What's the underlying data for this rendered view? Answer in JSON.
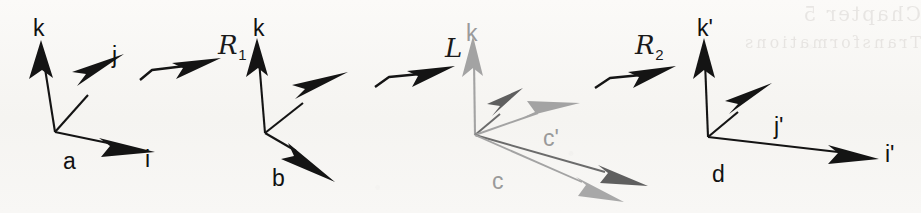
{
  "figure": {
    "kind": "vector-frame-transformation-diagram",
    "width": 921,
    "height": 213,
    "background_color": "#f7f6f4",
    "ink_color": "#111111",
    "mid_gray_color": "#5f5f5f",
    "light_gray_color": "#a3a3a3"
  },
  "operators": [
    {
      "name": "operator-r1",
      "text": "R",
      "subscript": "1"
    },
    {
      "name": "operator-l",
      "text": "L",
      "subscript": ""
    },
    {
      "name": "operator-r2",
      "text": "R",
      "subscript": "2"
    }
  ],
  "frames": [
    {
      "name": "frame-a",
      "origin_label": "a",
      "axis_labels": [
        "k",
        "j",
        "i"
      ]
    },
    {
      "name": "frame-b",
      "origin_label": "b",
      "axis_labels": [
        "k"
      ]
    },
    {
      "name": "frame-c",
      "origin_label": "c",
      "axis_labels": [
        "k",
        "c'"
      ]
    },
    {
      "name": "frame-d",
      "origin_label": "d",
      "axis_labels": [
        "k'",
        "j'",
        "i'"
      ]
    }
  ],
  "labels": {
    "k_a": "k",
    "j_a": "j",
    "i_a": "i",
    "a": "a",
    "k_b": "k",
    "b": "b",
    "k_c": "k",
    "c": "c",
    "c_prime": "c'",
    "k_prime": "k'",
    "j_prime": "j'",
    "i_prime": "i'",
    "d": "d"
  },
  "bleed_through": {
    "line1": "Chapter 5",
    "line2": "Transformations"
  }
}
